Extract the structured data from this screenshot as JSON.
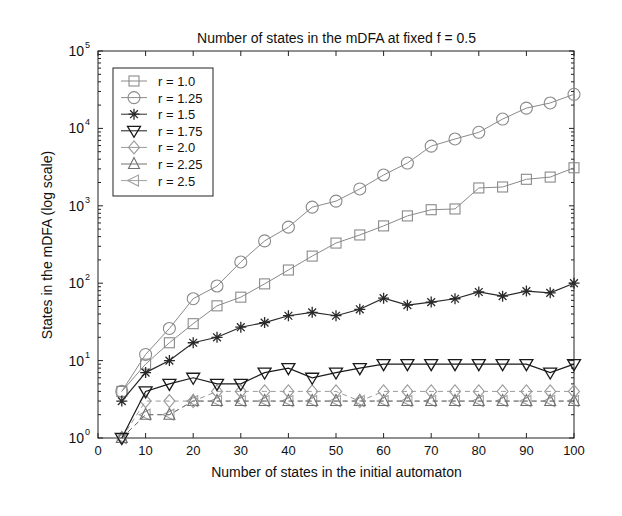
{
  "chart_data": {
    "type": "line",
    "title": "Number of states in the mDFA at fixed f = 0.5",
    "xlabel": "Number of states in the initial automaton",
    "ylabel": "States in the mDFA (log scale)",
    "xlim": [
      0,
      100
    ],
    "ylim": [
      1,
      100000
    ],
    "yscale": "log",
    "grid": false,
    "legend_position": "upper left",
    "x_ticks": [
      0,
      10,
      20,
      30,
      40,
      50,
      60,
      70,
      80,
      90,
      100
    ],
    "y_ticks": [
      {
        "value": 1,
        "label": "10",
        "exp": "0"
      },
      {
        "value": 10,
        "label": "10",
        "exp": "1"
      },
      {
        "value": 100,
        "label": "10",
        "exp": "2"
      },
      {
        "value": 1000,
        "label": "10",
        "exp": "3"
      },
      {
        "value": 10000,
        "label": "10",
        "exp": "4"
      },
      {
        "value": 100000,
        "label": "10",
        "exp": "5"
      }
    ],
    "x": [
      5,
      10,
      15,
      20,
      25,
      30,
      35,
      40,
      45,
      50,
      55,
      60,
      65,
      70,
      75,
      80,
      85,
      90,
      95,
      100
    ],
    "series": [
      {
        "name": "r = 1.0",
        "marker": "square",
        "color": "#8a8a8a",
        "dash": false,
        "values": [
          4,
          9,
          17,
          30,
          51,
          66,
          98,
          148,
          224,
          330,
          420,
          550,
          740,
          890,
          910,
          1700,
          1750,
          2200,
          2350,
          3100
        ]
      },
      {
        "name": "r = 1.25",
        "marker": "circle",
        "color": "#8a8a8a",
        "dash": false,
        "values": [
          4,
          12,
          26,
          63,
          92,
          188,
          352,
          530,
          960,
          1150,
          1650,
          2500,
          3570,
          5900,
          7300,
          8900,
          13200,
          18300,
          21300,
          27600
        ]
      },
      {
        "name": "r = 1.5",
        "marker": "star",
        "color": "#2a2a2a",
        "dash": false,
        "values": [
          3,
          7,
          10,
          17,
          20,
          27,
          31,
          38,
          42,
          38,
          46,
          64,
          52,
          57,
          63,
          77,
          68,
          79,
          75,
          100
        ]
      },
      {
        "name": "r = 1.75",
        "marker": "triangle-down",
        "color": "#1a1a1a",
        "dash": false,
        "values": [
          1,
          4,
          5,
          6,
          5,
          5,
          7,
          8,
          6,
          7,
          8,
          9,
          9,
          9,
          9,
          9,
          9,
          9,
          7,
          9
        ]
      },
      {
        "name": "r = 2.0",
        "marker": "diamond",
        "color": "#9a9a9a",
        "dash": true,
        "values": [
          1,
          3,
          3,
          3,
          4,
          4,
          4,
          4,
          4,
          4,
          3,
          4,
          4,
          4,
          4,
          4,
          4,
          4,
          4,
          4
        ]
      },
      {
        "name": "r = 2.25",
        "marker": "triangle-up",
        "color": "#707070",
        "dash": true,
        "values": [
          1,
          2,
          2,
          3,
          3,
          3,
          3,
          3,
          3,
          3,
          3,
          3,
          3,
          3,
          3,
          3,
          3,
          3,
          3,
          3
        ]
      },
      {
        "name": "r = 2.5",
        "marker": "triangle-left",
        "color": "#a0a0a0",
        "dash": true,
        "values": [
          1,
          2,
          2,
          3,
          3,
          3,
          3,
          3,
          3,
          3,
          3,
          3,
          3,
          3,
          3,
          3,
          3,
          3,
          3,
          3
        ]
      }
    ]
  }
}
